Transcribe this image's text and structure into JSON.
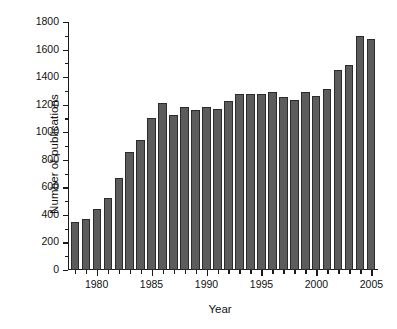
{
  "chart_data": {
    "type": "bar",
    "title": "",
    "subtitle": "",
    "xlabel": "Year",
    "ylabel": "Number of publications",
    "categories": [
      1978,
      1979,
      1980,
      1981,
      1982,
      1983,
      1984,
      1985,
      1986,
      1987,
      1988,
      1989,
      1990,
      1991,
      1992,
      1993,
      1994,
      1995,
      1996,
      1997,
      1998,
      1999,
      2000,
      2001,
      2002,
      2003,
      2004,
      2005
    ],
    "values": [
      350,
      370,
      440,
      520,
      670,
      860,
      940,
      1100,
      1210,
      1125,
      1180,
      1160,
      1180,
      1165,
      1230,
      1280,
      1280,
      1275,
      1290,
      1255,
      1235,
      1290,
      1260,
      1315,
      1450,
      1490,
      1700,
      1680
    ],
    "xlim": [
      1977.4,
      2005.6
    ],
    "ylim": [
      0,
      1800
    ],
    "yticks": [
      0,
      200,
      400,
      600,
      800,
      1000,
      1200,
      1400,
      1600,
      1800
    ],
    "ytick_labels": [
      "0",
      "200",
      "400",
      "600",
      "800",
      "1000",
      "1200",
      "1400",
      "1600",
      "1800"
    ],
    "y_minor_step": 100,
    "xticks": [
      1980,
      1985,
      1990,
      1995,
      2000,
      2005
    ],
    "xtick_labels": [
      "1980",
      "1985",
      "1990",
      "1995",
      "2000",
      "2005"
    ],
    "x_minor_step": 1,
    "grid": false,
    "legend": null,
    "bar_color": "#5c5c5c",
    "bar_edge_color": "#2b2b2b",
    "axis_color": "#1a1a1a",
    "background_color": "#ffffff"
  }
}
